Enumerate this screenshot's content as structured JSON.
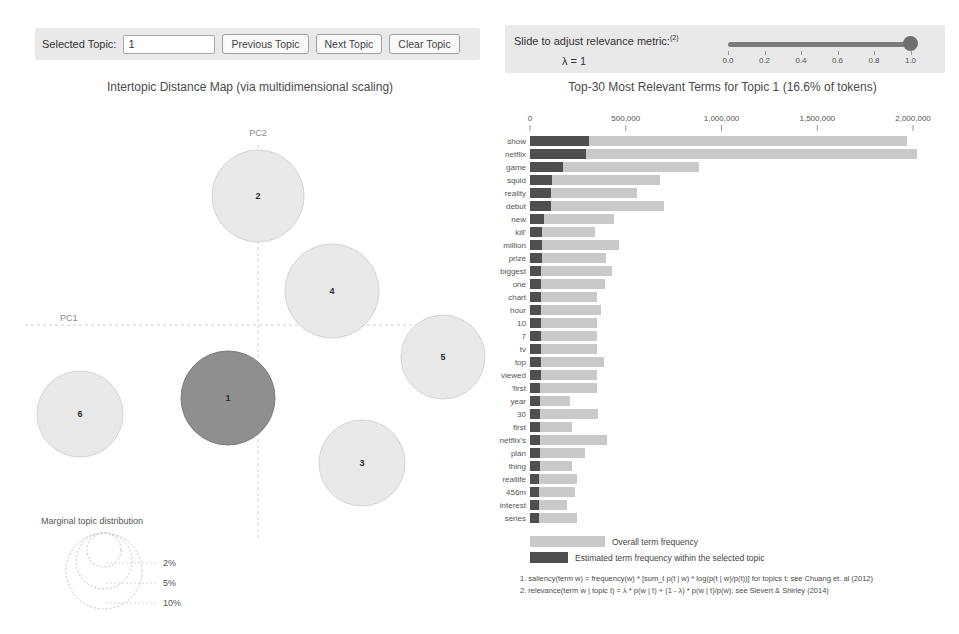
{
  "controls": {
    "selected_topic_label": "Selected Topic:",
    "selected_topic_value": "1",
    "prev_button": "Previous Topic",
    "next_button": "Next Topic",
    "clear_button": "Clear Topic",
    "slider_label": "Slide to adjust relevance metric:",
    "slider_label_sup": "(2)",
    "lambda_label": "λ = 1",
    "slider_ticks": [
      "0.0",
      "0.2",
      "0.4",
      "0.6",
      "0.8",
      "1.0"
    ],
    "slider_value": 1.0
  },
  "colors": {
    "panel_bg": "#e9e9e9",
    "bar_overall": "#c9c9c9",
    "bar_topic": "#4f4f4f",
    "circle_fill": "#e9e9e9",
    "circle_stroke": "#d4d4d4",
    "circle_selected_fill": "#8f8f8f",
    "circle_selected_stroke": "#7d7d7d",
    "axis_line": "#cfcfcf",
    "text_muted": "#555555"
  },
  "chart_data": [
    {
      "type": "scatter",
      "title": "Intertopic Distance Map (via multidimensional scaling)",
      "xlabel": "PC1",
      "ylabel": "PC2",
      "legend_title": "Marginal topic distribution",
      "legend_sizes": [
        "2%",
        "5%",
        "10%"
      ],
      "legend_radii": [
        17,
        28,
        38
      ],
      "axes_cross_px": {
        "x": 258,
        "y": 225
      },
      "topics": [
        {
          "id": 1,
          "x": 228,
          "y": 298,
          "r": 47,
          "selected": true
        },
        {
          "id": 2,
          "x": 258,
          "y": 96,
          "r": 46,
          "selected": false
        },
        {
          "id": 3,
          "x": 362,
          "y": 363,
          "r": 43,
          "selected": false
        },
        {
          "id": 4,
          "x": 332,
          "y": 191,
          "r": 47,
          "selected": false
        },
        {
          "id": 5,
          "x": 443,
          "y": 257,
          "r": 42,
          "selected": false
        },
        {
          "id": 6,
          "x": 80,
          "y": 314,
          "r": 43,
          "selected": false
        }
      ]
    },
    {
      "type": "bar",
      "title": "Top-30 Most Relevant Terms for Topic 1 (16.6% of tokens)",
      "xlim": [
        0,
        2000000
      ],
      "x_ticks": [
        "0",
        "500,000",
        "1,000,000",
        "1,500,000",
        "2,000,000"
      ],
      "x_tick_values": [
        0,
        500000,
        1000000,
        1500000,
        2000000
      ],
      "legend": [
        "Overall term frequency",
        "Estimated term frequency within the selected topic"
      ],
      "series_names": [
        "overall",
        "topic"
      ],
      "terms": [
        {
          "term": "show",
          "overall": 1970000,
          "topic": 310000
        },
        {
          "term": "netflix",
          "overall": 2020000,
          "topic": 295000
        },
        {
          "term": "game",
          "overall": 880000,
          "topic": 170000
        },
        {
          "term": "squid",
          "overall": 680000,
          "topic": 115000
        },
        {
          "term": "reality",
          "overall": 560000,
          "topic": 110000
        },
        {
          "term": "debut",
          "overall": 700000,
          "topic": 110000
        },
        {
          "term": "new",
          "overall": 440000,
          "topic": 75000
        },
        {
          "term": "kill'",
          "overall": 340000,
          "topic": 62000
        },
        {
          "term": "million",
          "overall": 465000,
          "topic": 65000
        },
        {
          "term": "prize",
          "overall": 395000,
          "topic": 64000
        },
        {
          "term": "biggest",
          "overall": 430000,
          "topic": 60000
        },
        {
          "term": "one",
          "overall": 390000,
          "topic": 60000
        },
        {
          "term": "chart",
          "overall": 350000,
          "topic": 58000
        },
        {
          "term": "hour",
          "overall": 370000,
          "topic": 58000
        },
        {
          "term": "10",
          "overall": 350000,
          "topic": 56000
        },
        {
          "term": "7",
          "overall": 350000,
          "topic": 55000
        },
        {
          "term": "tv",
          "overall": 350000,
          "topic": 55000
        },
        {
          "term": "top",
          "overall": 385000,
          "topic": 55000
        },
        {
          "term": "viewed",
          "overall": 350000,
          "topic": 55000
        },
        {
          "term": "'first",
          "overall": 350000,
          "topic": 54000
        },
        {
          "term": "year",
          "overall": 210000,
          "topic": 54000
        },
        {
          "term": "30",
          "overall": 355000,
          "topic": 52000
        },
        {
          "term": "first",
          "overall": 220000,
          "topic": 52000
        },
        {
          "term": "netflix's",
          "overall": 400000,
          "topic": 50000
        },
        {
          "term": "plan",
          "overall": 285000,
          "topic": 50000
        },
        {
          "term": "thing",
          "overall": 217000,
          "topic": 50000
        },
        {
          "term": "reallife",
          "overall": 245000,
          "topic": 46000
        },
        {
          "term": "456m",
          "overall": 235000,
          "topic": 46000
        },
        {
          "term": "interest",
          "overall": 195000,
          "topic": 45000
        },
        {
          "term": "series",
          "overall": 245000,
          "topic": 45000
        }
      ]
    }
  ],
  "footnotes": [
    "1. saliency(term w) = frequency(w) * [sum_t p(t | w) * log(p(t | w)/p(t))] for topics t; see Chuang et. al (2012)",
    "2. relevance(term w | topic t) = λ * p(w | t) + (1 - λ) * p(w | t)/p(w); see Sievert & Shirley (2014)"
  ]
}
